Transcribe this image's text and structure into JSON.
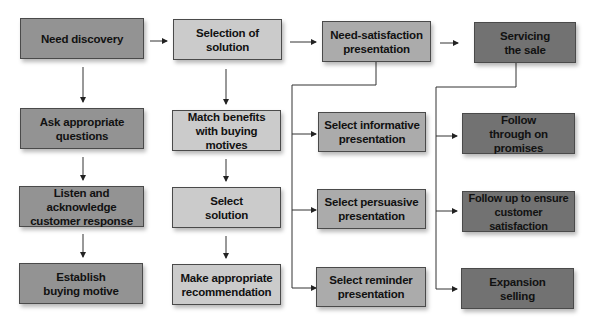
{
  "diagram": {
    "colors": {
      "column1": "#939393",
      "column2": "#cbcbcb",
      "column3": "#ababab",
      "column4": "#727272",
      "lines": "#333333"
    },
    "columns": [
      {
        "header": "Need discovery",
        "steps": [
          "Ask appropriate questions",
          "Listen and acknowledge customer response",
          "Establish buying motive"
        ]
      },
      {
        "header": "Selection of solution",
        "steps": [
          "Match benefits with buying motives",
          "Select solution",
          "Make appropriate recommendation"
        ]
      },
      {
        "header": "Need-satisfaction presentation",
        "steps": [
          "Select informative presentation",
          "Select persuasive presentation",
          "Select reminder presentation"
        ]
      },
      {
        "header": "Servicing the sale",
        "steps": [
          "Follow through on promises",
          "Follow up to ensure customer satisfaction",
          "Expansion selling"
        ]
      }
    ]
  }
}
